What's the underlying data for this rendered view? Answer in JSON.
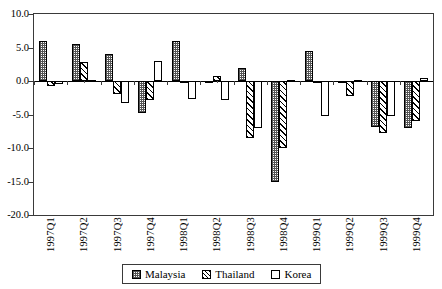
{
  "chart_data": {
    "type": "bar",
    "title": "",
    "subtitle": "",
    "xlabel": "",
    "ylabel": "",
    "ylim": [
      -20.0,
      10.0
    ],
    "yticks": [
      10.0,
      5.0,
      0.0,
      -5.0,
      -10.0,
      -15.0,
      -20.0
    ],
    "ytick_labels": [
      "10.0",
      "5.0",
      "0.0",
      "-5.0",
      "-10.0",
      "-15.0",
      "-20.0"
    ],
    "grid": false,
    "legend_position": "bottom",
    "categories": [
      "1997Q1",
      "1997Q2",
      "1997Q3",
      "1997Q4",
      "1998Q1",
      "1998Q2",
      "1998Q3",
      "1998Q4",
      "1999Q1",
      "1999Q2",
      "1999Q3",
      "1999Q4"
    ],
    "series": [
      {
        "name": "Malaysia",
        "pattern": "stippled-checker",
        "values": [
          6.0,
          5.5,
          4.0,
          -4.8,
          6.0,
          -0.3,
          2.0,
          -15.0,
          4.5,
          -0.3,
          -6.8,
          -7.0
        ]
      },
      {
        "name": "Thailand",
        "pattern": "diagonal-hatch",
        "values": [
          -0.7,
          2.8,
          -2.0,
          -2.8,
          -0.2,
          0.8,
          -8.5,
          -10.0,
          -0.2,
          -2.3,
          -7.8,
          -6.0
        ]
      },
      {
        "name": "Korea",
        "pattern": "solid-white",
        "values": [
          -0.5,
          0.2,
          -3.3,
          3.0,
          -2.7,
          -2.8,
          -7.0,
          0.2,
          -5.2,
          0.2,
          -5.2,
          0.5
        ]
      }
    ]
  },
  "legend": {
    "entries": [
      {
        "label": "Malaysia"
      },
      {
        "label": "Thailand"
      },
      {
        "label": "Korea"
      }
    ]
  }
}
